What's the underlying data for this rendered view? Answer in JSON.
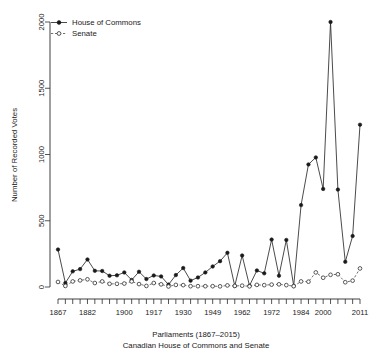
{
  "chart_data": {
    "type": "line",
    "title": "",
    "xlabel": "Parliaments (1867–2015)",
    "xlabel_line2": "Canadian House of Commons and Senate",
    "ylabel": "Number of Recorded Votes",
    "ylim": [
      0,
      2000
    ],
    "ytick_labels": [
      "0",
      "500",
      "1000",
      "1500",
      "2000"
    ],
    "ytick_values": [
      0,
      500,
      1000,
      1500,
      2000
    ],
    "xtick_labels": [
      "1867",
      "1882",
      "1900",
      "1917",
      "1930",
      "1949",
      "1962",
      "1972",
      "1984",
      "2000",
      "2011"
    ],
    "xtick_indices": [
      0,
      4,
      9,
      13,
      17,
      21,
      25,
      29,
      33,
      36,
      41
    ],
    "grid": false,
    "legend_position": "top-left",
    "x": [
      1,
      2,
      3,
      4,
      5,
      6,
      7,
      8,
      9,
      10,
      11,
      12,
      13,
      14,
      15,
      16,
      17,
      18,
      19,
      20,
      21,
      22,
      23,
      24,
      25,
      26,
      27,
      28,
      29,
      30,
      31,
      32,
      33,
      34,
      35,
      36,
      37,
      38,
      39,
      40,
      41,
      42
    ],
    "categories": [
      "1",
      "2",
      "3",
      "4",
      "5",
      "6",
      "7",
      "8",
      "9",
      "10",
      "11",
      "12",
      "13",
      "14",
      "15",
      "16",
      "17",
      "18",
      "19",
      "20",
      "21",
      "22",
      "23",
      "24",
      "25",
      "26",
      "27",
      "28",
      "29",
      "30",
      "31",
      "32",
      "33",
      "34",
      "35",
      "36",
      "37",
      "38",
      "39",
      "40",
      "41",
      "42"
    ],
    "series": [
      {
        "name": "House of Commons",
        "marker": "filled-circle",
        "line": "solid",
        "color": "#1a1a1a",
        "values": [
          283,
          30,
          118,
          135,
          208,
          122,
          121,
          85,
          88,
          110,
          53,
          115,
          60,
          87,
          80,
          18,
          90,
          143,
          48,
          72,
          110,
          155,
          195,
          258,
          8,
          238,
          10,
          125,
          103,
          358,
          85,
          355,
          8,
          618,
          925,
          978,
          740,
          2000,
          735,
          190,
          385,
          1225
        ]
      },
      {
        "name": "Senate",
        "marker": "open-circle",
        "line": "dashed",
        "color": "#3a3a3a",
        "values": [
          38,
          8,
          42,
          50,
          58,
          30,
          42,
          24,
          24,
          26,
          42,
          22,
          8,
          30,
          20,
          4,
          16,
          14,
          6,
          6,
          6,
          6,
          5,
          12,
          8,
          10,
          5,
          16,
          14,
          18,
          20,
          14,
          6,
          42,
          40,
          110,
          70,
          92,
          96,
          36,
          48,
          140
        ]
      }
    ]
  },
  "legend": {
    "items": [
      {
        "label": "House of Commons",
        "marker": "filled-circle",
        "line": "solid"
      },
      {
        "label": "Senate",
        "marker": "open-circle",
        "line": "dashed"
      }
    ]
  },
  "axes": {
    "y_title": "Number of Recorded Votes",
    "x_caption_line1": "Parliaments (1867–2015)",
    "x_caption_line2": "Canadian House of Commons and Senate"
  }
}
